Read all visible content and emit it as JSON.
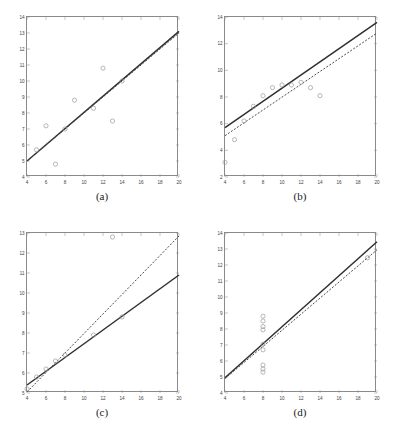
{
  "figure": {
    "panel_count": 4,
    "marker": "open-circle",
    "series_names": [
      "data-points",
      "solid-fit-line",
      "dashed-fit-line"
    ]
  },
  "chart_data": [
    {
      "type": "scatter",
      "panel": "a",
      "caption": "(a)",
      "title": "",
      "xlabel": "",
      "ylabel": "",
      "xlim": [
        4,
        20
      ],
      "ylim": [
        4,
        14
      ],
      "xticks": [
        4,
        6,
        8,
        10,
        12,
        14,
        16,
        18,
        20
      ],
      "yticks": [
        4,
        5,
        6,
        7,
        8,
        9,
        10,
        11,
        12,
        13,
        14
      ],
      "grid": false,
      "legend": "none",
      "x": [
        5,
        6,
        7,
        8,
        9,
        11,
        12,
        13,
        14
      ],
      "y": [
        5.7,
        7.2,
        4.8,
        7.0,
        8.8,
        8.3,
        10.8,
        7.5,
        10.0
      ],
      "series": [
        {
          "name": "solid-fit-line",
          "style": "solid",
          "x": [
            4,
            20
          ],
          "y": [
            5.0,
            13.1
          ]
        },
        {
          "name": "dashed-fit-line",
          "style": "dashed",
          "x": [
            4,
            20
          ],
          "y": [
            5.0,
            13.0
          ]
        }
      ]
    },
    {
      "type": "scatter",
      "panel": "b",
      "caption": "(b)",
      "title": "",
      "xlabel": "",
      "ylabel": "",
      "xlim": [
        4,
        20
      ],
      "ylim": [
        2,
        14
      ],
      "xticks": [
        4,
        6,
        8,
        10,
        12,
        14,
        16,
        18,
        20
      ],
      "yticks": [
        2,
        4,
        6,
        8,
        10,
        12,
        14
      ],
      "grid": false,
      "legend": "none",
      "x": [
        4,
        5,
        6,
        7,
        8,
        9,
        10,
        11,
        12,
        13,
        14
      ],
      "y": [
        3.1,
        4.8,
        6.2,
        7.3,
        8.1,
        8.7,
        8.9,
        8.9,
        9.1,
        8.7,
        8.1
      ],
      "series": [
        {
          "name": "solid-fit-line",
          "style": "solid",
          "x": [
            4,
            20
          ],
          "y": [
            5.7,
            13.6
          ]
        },
        {
          "name": "dashed-fit-line",
          "style": "dashed",
          "x": [
            4,
            20
          ],
          "y": [
            5.1,
            12.8
          ]
        }
      ]
    },
    {
      "type": "scatter",
      "panel": "c",
      "caption": "(c)",
      "title": "",
      "xlabel": "",
      "ylabel": "",
      "xlim": [
        4,
        20
      ],
      "ylim": [
        5,
        13
      ],
      "xticks": [
        4,
        6,
        8,
        10,
        12,
        14,
        16,
        18,
        20
      ],
      "yticks": [
        5,
        6,
        7,
        8,
        9,
        10,
        11,
        12,
        13
      ],
      "grid": false,
      "legend": "none",
      "x": [
        4,
        5,
        6,
        7,
        8,
        11,
        13,
        14
      ],
      "y": [
        5.2,
        5.8,
        6.2,
        6.6,
        6.9,
        7.9,
        12.8,
        8.8
      ],
      "series": [
        {
          "name": "solid-fit-line",
          "style": "solid",
          "x": [
            4,
            20
          ],
          "y": [
            5.4,
            10.9
          ]
        },
        {
          "name": "dashed-fit-line",
          "style": "dashed",
          "x": [
            4,
            20
          ],
          "y": [
            5.05,
            12.85
          ]
        }
      ]
    },
    {
      "type": "scatter",
      "panel": "d",
      "caption": "(d)",
      "title": "",
      "xlabel": "",
      "ylabel": "",
      "xlim": [
        4,
        20
      ],
      "ylim": [
        4,
        14
      ],
      "xticks": [
        4,
        6,
        8,
        10,
        12,
        14,
        16,
        18,
        20
      ],
      "yticks": [
        4,
        5,
        6,
        7,
        8,
        9,
        10,
        11,
        12,
        13,
        14
      ],
      "grid": false,
      "legend": "none",
      "x": [
        8,
        8,
        8,
        8,
        8,
        8,
        8,
        8,
        8,
        19
      ],
      "y": [
        8.8,
        8.5,
        8.15,
        7.95,
        7.05,
        6.7,
        5.75,
        5.5,
        5.3,
        12.45
      ],
      "series": [
        {
          "name": "solid-fit-line",
          "style": "solid",
          "x": [
            4,
            20
          ],
          "y": [
            4.95,
            13.45
          ]
        },
        {
          "name": "dashed-fit-line",
          "style": "dashed",
          "x": [
            4,
            20
          ],
          "y": [
            4.9,
            12.95
          ]
        }
      ]
    }
  ]
}
